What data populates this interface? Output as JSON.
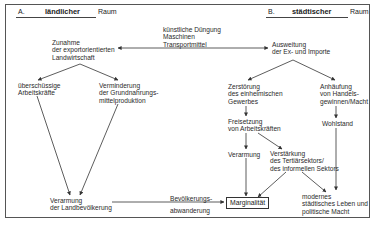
{
  "header": {
    "left": {
      "letter": "A.",
      "word": "ländlicher",
      "suffix": "Raum"
    },
    "right": {
      "letter": "B.",
      "word": "städtischer",
      "suffix": "Raum"
    }
  },
  "nodes": {
    "inputs": [
      "künstliche Düngung",
      "Maschinen",
      "Transportmittel"
    ],
    "zunahme": [
      "Zunahme",
      "der exportorientierten",
      "Landwirtschaft"
    ],
    "ausweitung": [
      "Ausweitung",
      "der Ex- und Importe"
    ],
    "ueberschuessige": [
      "überschüssige",
      "Arbeitskräfte"
    ],
    "verminderung": [
      "Verminderung",
      "der Grundnahrungs-",
      "mittelproduktion"
    ],
    "zerstoerung": [
      "Zerstörung",
      "des einheimischen",
      "Gewerbes"
    ],
    "anhaeufung": [
      "Anhäufung",
      "von Handels-",
      "gewinnen/Macht"
    ],
    "freisetzung": [
      "Freisetzung",
      "von Arbeitskräften"
    ],
    "wohlstand": [
      "Wohlstand"
    ],
    "verarmung_stadt": [
      "Verarmung"
    ],
    "verstaerkung": [
      "Verstärkung",
      "des Tertiärsektors/",
      "des informellen Sektors"
    ],
    "verarmung_land": [
      "Verarmung",
      "der Landbevölkerung"
    ],
    "abwanderung": [
      "Bevölkerungs-",
      "abwanderung"
    ],
    "marginalitaet": "Marginalität",
    "modernes": [
      "modernes",
      "städtisches Leben und",
      "politische Macht"
    ]
  }
}
